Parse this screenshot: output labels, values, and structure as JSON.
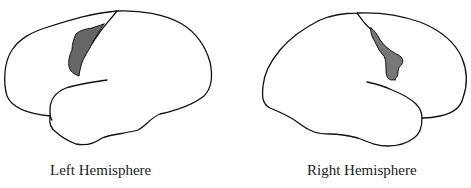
{
  "figure": {
    "panels": [
      {
        "id": "left",
        "label": "Left Hemisphere",
        "lesion_color": "#666666"
      },
      {
        "id": "right",
        "label": "Right Hemisphere",
        "lesion_color": "#777777"
      }
    ],
    "outline_color": "#111111",
    "background": "#ffffff"
  }
}
